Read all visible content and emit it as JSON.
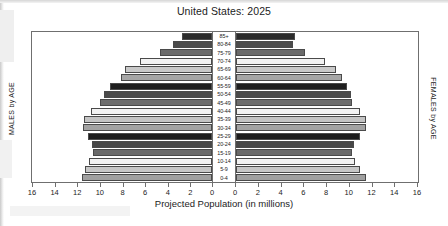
{
  "chart_data": {
    "type": "bar",
    "subtype": "population-pyramid",
    "title": "United States: 2025",
    "xlabel": "Projected Population (in millions)",
    "left_axis_label": "MALES by AGE",
    "right_axis_label": "FEMALES by AGE",
    "categories": [
      "85+",
      "80-84",
      "75-79",
      "70-74",
      "65-69",
      "60-64",
      "55-59",
      "50-54",
      "45-49",
      "40-44",
      "35-39",
      "30-34",
      "25-29",
      "20-24",
      "15-19",
      "10-14",
      "5-9",
      "0-4"
    ],
    "xlim": [
      0,
      16
    ],
    "xticks": [
      16,
      14,
      12,
      10,
      8,
      6,
      4,
      2,
      0
    ],
    "xticks_female": [
      0,
      2,
      4,
      6,
      8,
      10,
      12,
      14,
      16
    ],
    "grid": false,
    "legend": "none",
    "series": [
      {
        "name": "MALES by AGE",
        "side": "left",
        "values": [
          2.7,
          3.5,
          4.6,
          6.4,
          7.7,
          8.1,
          9.1,
          9.6,
          10.0,
          10.8,
          11.4,
          11.5,
          11.0,
          10.7,
          10.6,
          10.9,
          11.3,
          11.6
        ]
      },
      {
        "name": "FEMALES by AGE",
        "side": "right",
        "values": [
          5.2,
          5.0,
          6.1,
          7.8,
          8.8,
          9.3,
          9.8,
          10.1,
          10.2,
          10.9,
          11.4,
          11.4,
          10.9,
          10.4,
          10.2,
          10.5,
          10.9,
          11.4
        ]
      }
    ],
    "bar_colors": [
      "#2b2b2b",
      "#4b4b4b",
      "#6b6b6b",
      "#f2f2f2",
      "#c9c9c9",
      "#a6a6a6",
      "#1f1f1f",
      "#4a4a4a",
      "#6e6e6e",
      "#f2f2f2",
      "#c4c4c4",
      "#a3a3a3",
      "#1c1c1c",
      "#474747",
      "#6a6a6a",
      "#f2f2f2",
      "#c7c7c7",
      "#a0a0a0"
    ]
  },
  "icons": {
    "chart": "bar-chart-icon"
  }
}
